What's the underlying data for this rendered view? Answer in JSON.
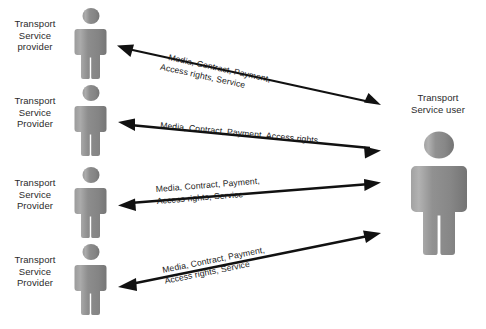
{
  "diagram": {
    "type": "actor-interaction-diagram",
    "background_color": "#ffffff",
    "figure_color": "#8a8a8a",
    "arrow_color": "#111111",
    "text_color": "#2b2b2b",
    "providers": [
      {
        "id": "provider-1",
        "label": "Transport\nService\nprovider"
      },
      {
        "id": "provider-2",
        "label": "Transport\nService\nProvider"
      },
      {
        "id": "provider-3",
        "label": "Transport\nService\nProvider"
      },
      {
        "id": "provider-4",
        "label": "Transport\nService\nProvider"
      }
    ],
    "user": {
      "id": "transport-service-user",
      "label": "Transport\nService user"
    },
    "connections": [
      {
        "id": "connection-1",
        "from": "provider-1",
        "to": "transport-service-user",
        "arrow": "double",
        "line1": "Media, Contract, Payment,",
        "line2": "Access rights, Service"
      },
      {
        "id": "connection-2",
        "from": "provider-2",
        "to": "transport-service-user",
        "arrow": "double",
        "line1": "Media, Contract, Payment, Access rights",
        "line2": ""
      },
      {
        "id": "connection-3",
        "from": "provider-3",
        "to": "transport-service-user",
        "arrow": "double",
        "line1": "Media, Contract, Payment,",
        "line2": "Access rights, Service"
      },
      {
        "id": "connection-4",
        "from": "provider-4",
        "to": "transport-service-user",
        "arrow": "double",
        "line1": "Media, Contract, Payment,",
        "line2": "Access rights, Service"
      }
    ]
  }
}
